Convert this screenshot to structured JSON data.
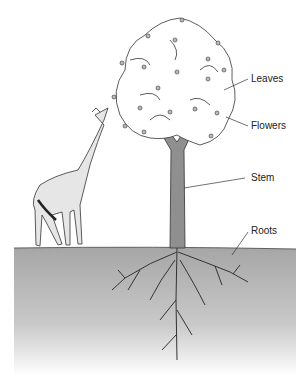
{
  "diagram": {
    "type": "labeled illustration",
    "subjects": [
      "tree",
      "giraffe"
    ],
    "labels": {
      "leaves": "Leaves",
      "flowers": "Flowers",
      "stem": "Stem",
      "roots": "Roots"
    },
    "colors": {
      "soil": "#a9a9a9",
      "trunk": "#8f8f8f",
      "giraffe_spots": "#c8c8c8",
      "line": "#333333"
    }
  }
}
